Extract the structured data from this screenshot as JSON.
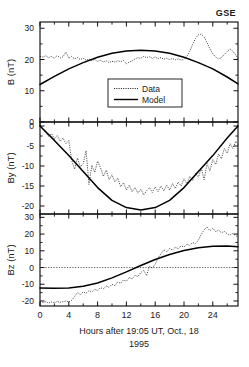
{
  "figure": {
    "corner_label": "GSE",
    "xlabel_line1": "Hours after 19:05 UT, Oct., 18",
    "xlabel_line2": "1995",
    "legend": {
      "data_label": "Data",
      "model_label": "Model"
    }
  },
  "chart_data": [
    {
      "type": "line",
      "panel": "B",
      "title": "",
      "xlabel": "Hours after 19:05 UT, Oct., 18 1995",
      "ylabel": "B (nT)",
      "xlim": [
        0,
        27.5
      ],
      "ylim": [
        0,
        32
      ],
      "yticks": [
        0,
        10,
        20,
        30
      ],
      "xticks": [
        0,
        4,
        8,
        12,
        16,
        20,
        24
      ],
      "grid": false,
      "legend_position": "center",
      "series": [
        {
          "name": "Data",
          "style": "dotted",
          "x": [
            0.0,
            0.4,
            0.8,
            1.2,
            1.6,
            2.0,
            2.4,
            2.8,
            3.2,
            3.6,
            4.0,
            4.4,
            4.8,
            5.2,
            5.6,
            6.0,
            6.4,
            6.8,
            7.2,
            7.6,
            8.0,
            8.4,
            8.8,
            9.2,
            9.6,
            10.0,
            10.4,
            10.8,
            11.2,
            11.6,
            12.0,
            12.4,
            12.8,
            13.2,
            13.6,
            14.0,
            14.4,
            14.8,
            15.2,
            15.6,
            16.0,
            16.4,
            16.8,
            17.2,
            17.6,
            18.0,
            18.4,
            18.8,
            19.2,
            19.6,
            20.0,
            20.4,
            20.8,
            21.2,
            21.6,
            22.0,
            22.4,
            22.8,
            23.2,
            23.6,
            24.0,
            24.4,
            24.8,
            25.2,
            25.6,
            26.0,
            26.4,
            26.8,
            27.2,
            27.5
          ],
          "y": [
            21.0,
            20.8,
            21.2,
            20.6,
            21.0,
            20.4,
            21.3,
            20.5,
            20.9,
            22.4,
            20.4,
            21.0,
            20.2,
            20.6,
            20.0,
            20.4,
            19.8,
            20.2,
            19.6,
            20.0,
            19.4,
            19.8,
            19.2,
            19.6,
            19.0,
            19.4,
            19.2,
            19.6,
            19.3,
            19.7,
            18.6,
            19.2,
            19.6,
            20.2,
            20.6,
            20.4,
            21.0,
            20.6,
            20.9,
            20.4,
            20.8,
            20.3,
            20.6,
            20.1,
            20.4,
            20.0,
            20.3,
            19.9,
            20.2,
            19.8,
            20.1,
            21.0,
            22.6,
            24.8,
            26.8,
            27.9,
            28.1,
            27.2,
            25.4,
            23.4,
            21.8,
            20.8,
            20.2,
            20.6,
            21.6,
            22.6,
            23.4,
            22.6,
            21.4,
            20.2
          ]
        },
        {
          "name": "Model",
          "style": "solid",
          "x": [
            0,
            2,
            4,
            6,
            8,
            10,
            12,
            14,
            16,
            18,
            20,
            22,
            24,
            26,
            27.5
          ],
          "y": [
            12.0,
            14.6,
            17.0,
            19.0,
            20.7,
            22.0,
            22.7,
            23.0,
            22.7,
            22.0,
            20.7,
            19.0,
            17.0,
            14.4,
            12.2
          ]
        }
      ]
    },
    {
      "type": "line",
      "panel": "By",
      "title": "",
      "xlabel": "",
      "ylabel": "By (nT)",
      "xlim": [
        0,
        27.5
      ],
      "ylim": [
        -22,
        1
      ],
      "yticks": [
        0,
        -5,
        -10,
        -15,
        -20
      ],
      "xticks": [
        0,
        4,
        8,
        12,
        16,
        20,
        24
      ],
      "grid": false,
      "series": [
        {
          "name": "Data",
          "style": "dotted",
          "x": [
            0.0,
            0.4,
            0.8,
            1.2,
            1.6,
            2.0,
            2.4,
            2.8,
            3.2,
            3.6,
            4.0,
            4.4,
            4.8,
            5.2,
            5.6,
            6.0,
            6.4,
            6.8,
            7.2,
            7.6,
            8.0,
            8.4,
            8.8,
            9.2,
            9.6,
            10.0,
            10.4,
            10.8,
            11.2,
            11.6,
            12.0,
            12.4,
            12.8,
            13.2,
            13.6,
            14.0,
            14.4,
            14.8,
            15.2,
            15.6,
            16.0,
            16.4,
            16.8,
            17.2,
            17.6,
            18.0,
            18.4,
            18.8,
            19.2,
            19.6,
            20.0,
            20.4,
            20.8,
            21.2,
            21.6,
            22.0,
            22.4,
            22.8,
            23.2,
            23.6,
            24.0,
            24.4,
            24.8,
            25.2,
            25.6,
            26.0,
            26.4,
            26.8,
            27.2,
            27.5
          ],
          "y": [
            0.2,
            -0.8,
            -1.6,
            -2.6,
            -1.9,
            -3.2,
            -2.4,
            -3.8,
            -3.0,
            -4.4,
            -3.6,
            -8.6,
            -10.8,
            -8.0,
            -10.2,
            -9.4,
            -6.2,
            -14.6,
            -9.8,
            -11.6,
            -8.8,
            -10.4,
            -12.6,
            -11.0,
            -13.4,
            -12.2,
            -14.0,
            -13.0,
            -15.2,
            -14.2,
            -16.0,
            -14.8,
            -16.4,
            -15.4,
            -16.8,
            -15.8,
            -17.2,
            -16.2,
            -15.4,
            -16.6,
            -15.2,
            -16.4,
            -15.0,
            -16.2,
            -14.8,
            -16.0,
            -14.4,
            -15.6,
            -14.0,
            -15.0,
            -13.2,
            -14.4,
            -12.6,
            -13.6,
            -11.8,
            -12.8,
            -10.6,
            -13.4,
            -9.4,
            -11.2,
            -8.4,
            -9.6,
            -7.0,
            -8.2,
            -5.6,
            -6.8,
            -4.4,
            -5.6,
            -3.8,
            -4.6
          ]
        },
        {
          "name": "Model",
          "style": "solid",
          "x": [
            0,
            2,
            4,
            6,
            8,
            10,
            12,
            14,
            16,
            18,
            20,
            22,
            24,
            26,
            27.5
          ],
          "y": [
            0.0,
            -3.6,
            -7.4,
            -11.4,
            -15.4,
            -18.6,
            -20.4,
            -21.0,
            -20.4,
            -18.6,
            -15.4,
            -11.4,
            -7.4,
            -3.0,
            0.0
          ]
        }
      ]
    },
    {
      "type": "line",
      "panel": "Bz",
      "title": "",
      "xlabel": "",
      "ylabel": "Bz (nT)",
      "xlim": [
        0,
        27.5
      ],
      "ylim": [
        -23,
        32
      ],
      "yticks": [
        30,
        20,
        10,
        0,
        -10,
        -20
      ],
      "xticks": [
        0,
        4,
        8,
        12,
        16,
        20,
        24
      ],
      "grid": false,
      "reference_line_y": 0,
      "series": [
        {
          "name": "Data",
          "style": "dotted",
          "x": [
            0.0,
            0.4,
            0.8,
            1.2,
            1.6,
            2.0,
            2.4,
            2.8,
            3.2,
            3.6,
            4.0,
            4.4,
            4.8,
            5.2,
            5.6,
            6.0,
            6.4,
            6.8,
            7.2,
            7.6,
            8.0,
            8.4,
            8.8,
            9.2,
            9.6,
            10.0,
            10.4,
            10.8,
            11.2,
            11.6,
            12.0,
            12.4,
            12.8,
            13.2,
            13.6,
            14.0,
            14.4,
            14.8,
            15.2,
            15.6,
            16.0,
            16.4,
            16.8,
            17.2,
            17.6,
            18.0,
            18.4,
            18.8,
            19.2,
            19.6,
            20.0,
            20.4,
            20.8,
            21.2,
            21.6,
            22.0,
            22.4,
            22.8,
            23.2,
            23.6,
            24.0,
            24.4,
            24.8,
            25.2,
            25.6,
            26.0,
            26.4,
            26.8,
            27.2,
            27.5
          ],
          "y": [
            -20.6,
            -21.0,
            -20.4,
            -21.2,
            -20.6,
            -21.0,
            -20.2,
            -20.8,
            -20.4,
            -20.0,
            -20.6,
            -19.6,
            -17.4,
            -15.0,
            -16.2,
            -14.6,
            -15.4,
            -13.8,
            -14.6,
            -13.0,
            -13.8,
            -12.0,
            -12.8,
            -11.0,
            -11.8,
            -10.0,
            -10.8,
            -8.6,
            -9.4,
            -7.4,
            -8.2,
            -6.0,
            -6.8,
            -4.6,
            -5.4,
            -3.0,
            -1.6,
            -4.8,
            0.8,
            -0.4,
            2.0,
            5.6,
            8.2,
            10.6,
            9.4,
            11.4,
            10.4,
            12.2,
            11.2,
            13.0,
            12.2,
            14.0,
            13.2,
            15.0,
            14.2,
            16.4,
            19.8,
            22.6,
            24.2,
            22.0,
            23.6,
            21.4,
            22.4,
            20.8,
            21.6,
            20.2,
            19.4,
            20.4,
            19.0,
            18.2
          ]
        },
        {
          "name": "Model",
          "style": "solid",
          "x": [
            0,
            2,
            4,
            6,
            8,
            10,
            12,
            14,
            16,
            18,
            20,
            22,
            24,
            26,
            27.5
          ],
          "y": [
            -12.2,
            -12.4,
            -12.2,
            -11.2,
            -9.2,
            -6.2,
            -2.6,
            1.2,
            4.8,
            7.8,
            10.2,
            11.8,
            12.7,
            12.8,
            12.4
          ]
        }
      ]
    }
  ]
}
